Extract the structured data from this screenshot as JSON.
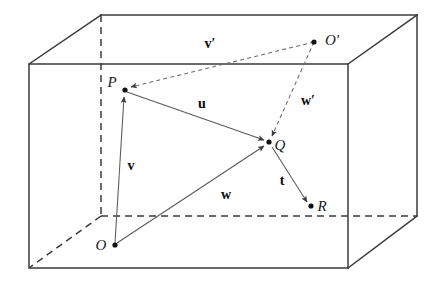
{
  "figure": {
    "background_color": "#ffffff",
    "edge_color": "#3b3b3b",
    "vector_color": "#5a5a5a",
    "label_color": "#111111",
    "width": 437,
    "height": 292
  },
  "points": [
    {
      "id": "O",
      "label": "O",
      "x": 115,
      "y": 245,
      "label_x": 101,
      "label_y": 250,
      "label_anchor": "middle"
    },
    {
      "id": "P",
      "label": "P",
      "x": 125,
      "y": 90,
      "label_x": 112,
      "label_y": 87,
      "label_anchor": "middle"
    },
    {
      "id": "Q",
      "label": "Q",
      "x": 269,
      "y": 142,
      "label_x": 280,
      "label_y": 150,
      "label_anchor": "middle"
    },
    {
      "id": "R",
      "label": "R",
      "x": 311,
      "y": 206,
      "label_x": 322,
      "label_y": 211,
      "label_anchor": "middle"
    },
    {
      "id": "Oprime",
      "label": "O′",
      "x": 314,
      "y": 42,
      "label_x": 332,
      "label_y": 45,
      "label_anchor": "middle"
    }
  ],
  "vectors": [
    {
      "id": "u",
      "label": "u",
      "from": "P",
      "to": "Q",
      "style": "solid",
      "label_x": 202,
      "label_y": 108
    },
    {
      "id": "v",
      "label": "v",
      "from": "O",
      "to": "P",
      "style": "solid",
      "label_x": 131,
      "label_y": 170
    },
    {
      "id": "w",
      "label": "w",
      "from": "O",
      "to": "Q",
      "style": "solid",
      "label_x": 226,
      "label_y": 199
    },
    {
      "id": "t",
      "label": "t",
      "from": "Q",
      "to": "R",
      "style": "solid",
      "label_x": 282,
      "label_y": 185
    },
    {
      "id": "vp",
      "label": "v′",
      "from": "Oprime",
      "to": "P",
      "style": "dashed",
      "label_x": 210,
      "label_y": 48
    },
    {
      "id": "wp",
      "label": "w′",
      "from": "Oprime",
      "to": "Q",
      "style": "dashed",
      "label_x": 308,
      "label_y": 105
    }
  ],
  "box": {
    "corners": {
      "front_top_left": {
        "x": 29,
        "y": 64
      },
      "front_top_right": {
        "x": 348,
        "y": 64
      },
      "front_bottom_left": {
        "x": 29,
        "y": 268
      },
      "front_bottom_right": {
        "x": 348,
        "y": 268
      },
      "back_top_left": {
        "x": 101,
        "y": 15
      },
      "back_top_right": {
        "x": 417,
        "y": 15
      },
      "back_bottom_left": {
        "x": 101,
        "y": 216
      },
      "back_bottom_right": {
        "x": 417,
        "y": 216
      }
    },
    "solid_edges": [
      "front_top_left-front_top_right",
      "front_top_right-front_bottom_right",
      "front_bottom_right-front_bottom_left",
      "front_bottom_left-front_top_left",
      "back_top_left-back_top_right",
      "back_top_right-back_bottom_right",
      "front_top_left-back_top_left",
      "front_top_right-back_top_right",
      "front_bottom_right-back_bottom_right"
    ],
    "dashed_edges": [
      "back_top_left-back_bottom_left",
      "back_bottom_left-back_bottom_right",
      "back_bottom_left-front_bottom_left"
    ]
  }
}
